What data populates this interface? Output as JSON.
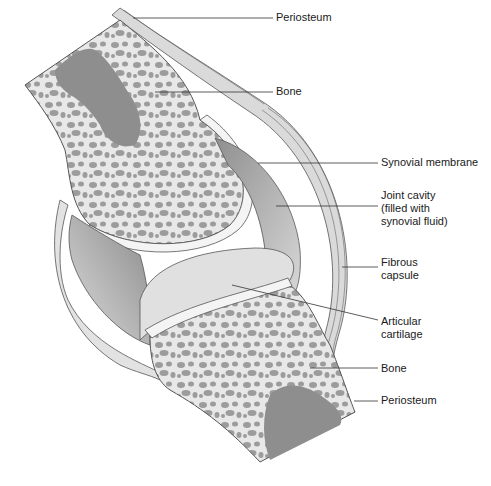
{
  "labels": [
    {
      "id": "periosteum-top",
      "text": "Periosteum",
      "x": 276,
      "y": 11
    },
    {
      "id": "bone-top",
      "text": "Bone",
      "x": 276,
      "y": 85
    },
    {
      "id": "synovial-membrane",
      "text": "Synovial membrane",
      "x": 381,
      "y": 155
    },
    {
      "id": "joint-cavity",
      "text": "Joint cavity\n(filled with\nsynovial fluid)",
      "x": 381,
      "y": 189
    },
    {
      "id": "fibrous-capsule",
      "text": "Fibrous\ncapsule",
      "x": 381,
      "y": 256
    },
    {
      "id": "articular-cartilage",
      "text": "Articular\ncartilage",
      "x": 381,
      "y": 315
    },
    {
      "id": "bone-bottom",
      "text": "Bone",
      "x": 381,
      "y": 362
    },
    {
      "id": "periosteum-bottom",
      "text": "Periosteum",
      "x": 381,
      "y": 394
    }
  ],
  "colors": {
    "bone_fill": "#e6e6e6",
    "spongy": "#9a9a9a",
    "marrow": "#8e8e8e",
    "cartilage": "#f2f2f2",
    "cavity": "#bdbdbd",
    "capsule": "#d9d9d9",
    "outline": "#555555",
    "leader": "#333333"
  }
}
